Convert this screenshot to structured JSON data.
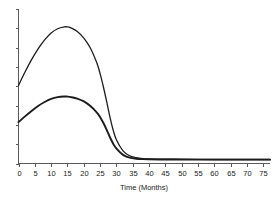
{
  "chart_data": {
    "type": "line",
    "title": "",
    "subtitle": "",
    "xlabel": "Time (Months)",
    "ylabel": "",
    "xlim": [
      0,
      77
    ],
    "ylim": [
      0,
      1.0
    ],
    "grid": false,
    "legend": null,
    "xticks": [
      0,
      5,
      10,
      15,
      20,
      25,
      30,
      35,
      40,
      45,
      50,
      55,
      60,
      65,
      70,
      75
    ],
    "xticklabels": [
      "0",
      "5",
      "10",
      "15",
      "20",
      "25",
      "30",
      "35",
      "40",
      "45",
      "50",
      "55",
      "60",
      "65",
      "70",
      "75"
    ],
    "yticks": [
      0.0,
      0.125,
      0.25,
      0.375,
      0.5,
      0.625,
      0.75,
      0.875,
      1.0
    ],
    "yticklabels": [
      "",
      "",
      "",
      "",
      "",
      "",
      "",
      "",
      ""
    ],
    "x": [
      0,
      2,
      4,
      6,
      8,
      10,
      12,
      14,
      15,
      16,
      18,
      20,
      22,
      24,
      25,
      26,
      27,
      28,
      29,
      30,
      32,
      34,
      36,
      38,
      40,
      45,
      50,
      55,
      60,
      65,
      70,
      75,
      77
    ],
    "series": [
      {
        "name": "upper-curve",
        "color": "#1c1c1c",
        "linewidth": 1.3,
        "values": [
          0.505,
          0.592,
          0.672,
          0.742,
          0.8,
          0.845,
          0.872,
          0.884,
          0.884,
          0.878,
          0.855,
          0.812,
          0.748,
          0.65,
          0.58,
          0.495,
          0.4,
          0.3,
          0.215,
          0.152,
          0.082,
          0.05,
          0.038,
          0.032,
          0.03,
          0.028,
          0.027,
          0.027,
          0.026,
          0.026,
          0.026,
          0.026,
          0.026
        ]
      },
      {
        "name": "lower-curve",
        "color": "#1c1c1c",
        "linewidth": 1.9,
        "values": [
          0.268,
          0.305,
          0.34,
          0.372,
          0.398,
          0.418,
          0.43,
          0.434,
          0.433,
          0.43,
          0.42,
          0.402,
          0.372,
          0.33,
          0.3,
          0.262,
          0.218,
          0.17,
          0.128,
          0.096,
          0.056,
          0.038,
          0.031,
          0.028,
          0.027,
          0.026,
          0.026,
          0.025,
          0.025,
          0.025,
          0.025,
          0.025,
          0.025
        ]
      }
    ]
  },
  "axes": {
    "x_axis_title": "Time (Months)"
  }
}
